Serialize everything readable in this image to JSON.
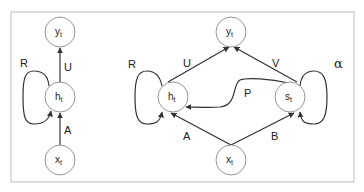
{
  "diagram": {
    "title": "",
    "left_graph": {
      "nodes": {
        "y": {
          "main": "y",
          "sub": "t"
        },
        "h": {
          "main": "h",
          "sub": "t"
        },
        "x": {
          "main": "x",
          "sub": "t"
        }
      },
      "edges": {
        "recurrent": {
          "label": "R",
          "from": "h_t",
          "to": "h_t"
        },
        "input": {
          "label": "A",
          "from": "x_t",
          "to": "h_t"
        },
        "output": {
          "label": "U",
          "from": "h_t",
          "to": "y_t"
        }
      }
    },
    "right_graph": {
      "nodes": {
        "y": {
          "main": "y",
          "sub": "t"
        },
        "h": {
          "main": "h",
          "sub": "t"
        },
        "s": {
          "main": "s",
          "sub": "t"
        },
        "x": {
          "main": "x",
          "sub": "t"
        }
      },
      "edges": {
        "h_recurrent": {
          "label": "R",
          "from": "h_t",
          "to": "h_t"
        },
        "s_recurrent": {
          "label": "α",
          "from": "s_t",
          "to": "s_t"
        },
        "h_output": {
          "label": "U",
          "from": "h_t",
          "to": "y_t"
        },
        "s_output": {
          "label": "V",
          "from": "s_t",
          "to": "y_t"
        },
        "s_to_h": {
          "label": "P",
          "from": "s_t",
          "to": "h_t"
        },
        "x_to_h": {
          "label": "A",
          "from": "x_t",
          "to": "h_t"
        },
        "x_to_s": {
          "label": "B",
          "from": "x_t",
          "to": "s_t"
        }
      }
    },
    "colors": {
      "frame": "#c8c8c8",
      "node_stroke": "#8a8a8a",
      "edge": "#333333",
      "text": "#222222"
    }
  }
}
